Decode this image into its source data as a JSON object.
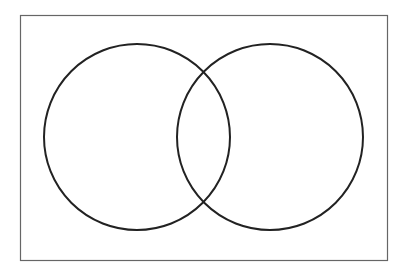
{
  "diagram": {
    "type": "venn",
    "frame": {
      "x": 20.5,
      "y": 15.5,
      "width": 367,
      "height": 245,
      "stroke": "#666666"
    },
    "sets": [
      {
        "name": "left-set",
        "cx": 137,
        "cy": 137,
        "r": 93,
        "stroke": "#222222"
      },
      {
        "name": "right-set",
        "cx": 270,
        "cy": 137,
        "r": 93,
        "stroke": "#222222"
      }
    ]
  }
}
